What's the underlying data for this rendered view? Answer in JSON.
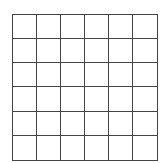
{
  "grid": {
    "rows": 6,
    "cols": 6,
    "line_color": "#444444",
    "background": "#ffffff",
    "cells": []
  }
}
